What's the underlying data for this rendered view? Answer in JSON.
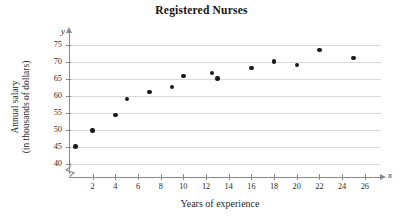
{
  "chart_data": {
    "type": "scatter",
    "title": "Registered Nurses",
    "xlabel": "Years of experience",
    "ylabel_line1": "Annual salary",
    "ylabel_line2": "(in thousands of dollars)",
    "x_axis_symbol": "x",
    "y_axis_symbol": "y",
    "xlim": [
      0,
      27
    ],
    "ylim": [
      38,
      77
    ],
    "y_axis_break": true,
    "grid": true,
    "legend": null,
    "xticks": [
      2,
      4,
      6,
      8,
      10,
      12,
      14,
      16,
      18,
      20,
      22,
      24,
      26
    ],
    "yticks": [
      40,
      45,
      50,
      55,
      60,
      65,
      70,
      75
    ],
    "points": [
      {
        "x": 0.5,
        "y": 45.2
      },
      {
        "x": 2.0,
        "y": 49.8
      },
      {
        "x": 4.0,
        "y": 54.5
      },
      {
        "x": 5.0,
        "y": 59.2
      },
      {
        "x": 7.0,
        "y": 61.2
      },
      {
        "x": 9.0,
        "y": 62.7
      },
      {
        "x": 10.0,
        "y": 65.8
      },
      {
        "x": 12.5,
        "y": 66.8
      },
      {
        "x": 13.0,
        "y": 65.1
      },
      {
        "x": 16.0,
        "y": 68.2
      },
      {
        "x": 18.0,
        "y": 70.2
      },
      {
        "x": 20.0,
        "y": 69.1
      },
      {
        "x": 22.0,
        "y": 73.5
      },
      {
        "x": 25.0,
        "y": 71.2
      }
    ],
    "colors": {
      "point": "#1a1a1a",
      "gridline": "#d8d8d8",
      "axis": "#8a8a8a",
      "text": "#1f1f1f"
    }
  }
}
